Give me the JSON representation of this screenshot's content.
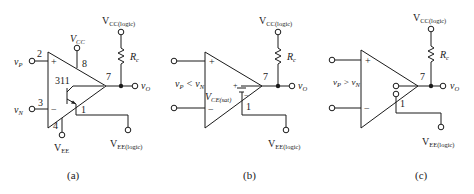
{
  "figure": {
    "panels": [
      {
        "id": "a",
        "caption": "(a)",
        "chip_label": "311",
        "inputs": {
          "plus_label": "v",
          "plus_sub": "P",
          "minus_label": "v",
          "minus_sub": "N"
        },
        "pins": {
          "plus": "2",
          "minus": "3",
          "vcc": "8",
          "vee": "4",
          "out": "7",
          "emitter": "1"
        },
        "supply_top": {
          "label": "V",
          "sub": "CC"
        },
        "supply_bottom": {
          "label": "V",
          "sub": "EE"
        },
        "logic_supply_top": {
          "label": "V",
          "sub": "CC(logic)"
        },
        "logic_supply_bottom": {
          "label": "V",
          "sub": "EE(logic)"
        },
        "resistor": {
          "label": "R",
          "sub": "c"
        },
        "output": {
          "label": "v",
          "sub": "O"
        }
      },
      {
        "id": "b",
        "caption": "(b)",
        "condition": {
          "text": "v",
          "sub1": "P",
          "op": " < v",
          "sub2": "N"
        },
        "sat_label": {
          "text": "V",
          "sub": "CE(sat)"
        },
        "pins": {
          "out": "7",
          "emitter": "1"
        },
        "logic_supply_top": {
          "label": "V",
          "sub": "CC(logic)"
        },
        "logic_supply_bottom": {
          "label": "V",
          "sub": "EE(logic)"
        },
        "resistor": {
          "label": "R",
          "sub": "c"
        },
        "output": {
          "label": "v",
          "sub": "O"
        },
        "signs": {
          "plus": "+",
          "minus": "−",
          "sat_plus": "+",
          "sat_minus": "−"
        }
      },
      {
        "id": "c",
        "caption": "(c)",
        "condition": {
          "text": "v",
          "sub1": "P",
          "op": " > v",
          "sub2": "N"
        },
        "pins": {
          "out": "7",
          "emitter": "1"
        },
        "logic_supply_top": {
          "label": "V",
          "sub": "CC(logic)"
        },
        "logic_supply_bottom": {
          "label": "V",
          "sub": "EE(logic)"
        },
        "resistor": {
          "label": "R",
          "sub": "c"
        },
        "output": {
          "label": "v",
          "sub": "O"
        },
        "signs": {
          "plus": "+",
          "minus": "−"
        }
      }
    ],
    "signs": {
      "plus": "+",
      "minus": "−"
    }
  }
}
